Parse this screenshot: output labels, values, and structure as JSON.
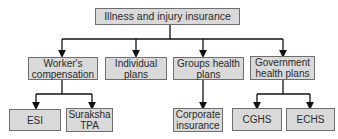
{
  "diagram": {
    "type": "hierarchy-tree",
    "colors": {
      "box_fill": "#d9d9d9",
      "box_border": "#6e6e6e",
      "line": "#111111",
      "text": "#2a2a2a"
    },
    "root": {
      "label": "Illness and injury insurance"
    },
    "level2": [
      {
        "id": "workers",
        "label_line1": "Worker's",
        "label_line2": "compensation"
      },
      {
        "id": "individual",
        "label_line1": "Individual",
        "label_line2": "plans"
      },
      {
        "id": "groups",
        "label_line1": "Groups health",
        "label_line2": "plans"
      },
      {
        "id": "government",
        "label_line1": "Government",
        "label_line2": "health plans"
      }
    ],
    "level3": [
      {
        "id": "esi",
        "parent": "workers",
        "label_line1": "ESI",
        "label_line2": ""
      },
      {
        "id": "suraksha",
        "parent": "workers",
        "label_line1": "Suraksha",
        "label_line2": "TPA"
      },
      {
        "id": "corporate",
        "parent": "groups",
        "label_line1": "Corporate",
        "label_line2": "insurance"
      },
      {
        "id": "cghs",
        "parent": "government",
        "label_line1": "CGHS",
        "label_line2": ""
      },
      {
        "id": "echs",
        "parent": "government",
        "label_line1": "ECHS",
        "label_line2": ""
      }
    ]
  }
}
